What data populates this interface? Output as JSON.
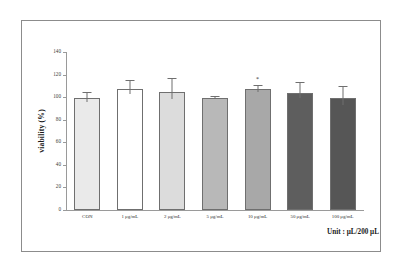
{
  "chart_data": {
    "type": "bar",
    "title": "",
    "xlabel": "",
    "ylabel": "viability (%)",
    "ylim": [
      0,
      140
    ],
    "yticks": [
      0,
      20,
      40,
      60,
      80,
      100,
      120,
      140
    ],
    "ytick_labels": [
      "0",
      "20",
      "40",
      "60",
      "80",
      "100",
      "120",
      "140"
    ],
    "grid": false,
    "legend": "none",
    "categories": [
      "CON",
      "1 μg/mL",
      "2 μg/mL",
      "5 μg/mL",
      "10 μg/mL",
      "50 μg/mL",
      "100 μg/mL"
    ],
    "values": [
      99,
      107,
      105,
      99,
      107,
      104,
      99
    ],
    "errors": [
      6,
      8,
      12,
      2,
      4,
      9,
      11
    ],
    "bar_colors": [
      "#eaeaea",
      "#ffffff",
      "#dcdcdc",
      "#b8b8b8",
      "#a8a8a8",
      "#5e5e5e",
      "#565656"
    ],
    "bar_edge_color": "#6f6f6f",
    "annotations": [
      {
        "category": "10 μg/mL",
        "text": "*",
        "index": 4
      }
    ],
    "caption": "Unit : μL/200 μL"
  },
  "axis": {
    "y_title": "viability (%)"
  },
  "figure": {
    "frame_color": "#8c8c8c",
    "background": "#ffffff"
  }
}
